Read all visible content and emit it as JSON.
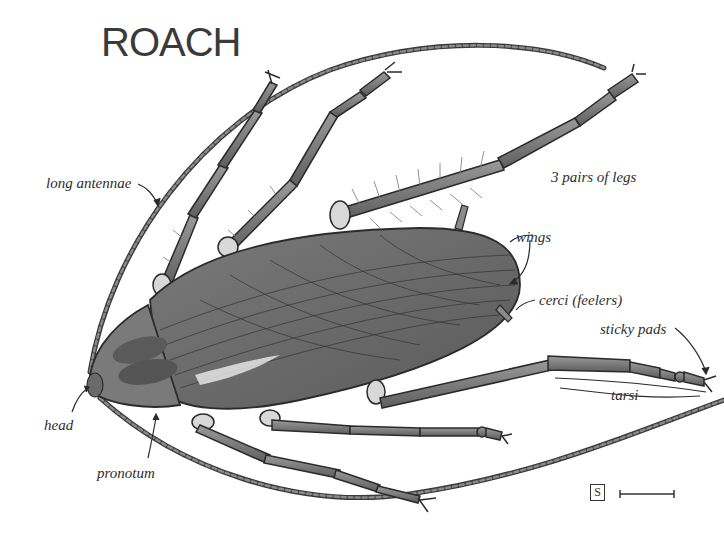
{
  "diagram": {
    "title": "ROACH",
    "labels": {
      "long_antennae": "long antennae",
      "three_pairs_of_legs": "3 pairs of legs",
      "wings": "wings",
      "cerci": "cerci  (feelers)",
      "sticky_pads": "sticky pads",
      "tarsi": "tarsi",
      "head": "head",
      "pronotum": "pronotum"
    },
    "scale": {
      "box_letter": "S"
    },
    "colors": {
      "background": "#ffffff",
      "body_fill": "#6e6e6e",
      "outline": "#2b2b2b",
      "label_text": "#2e2e2e"
    }
  }
}
